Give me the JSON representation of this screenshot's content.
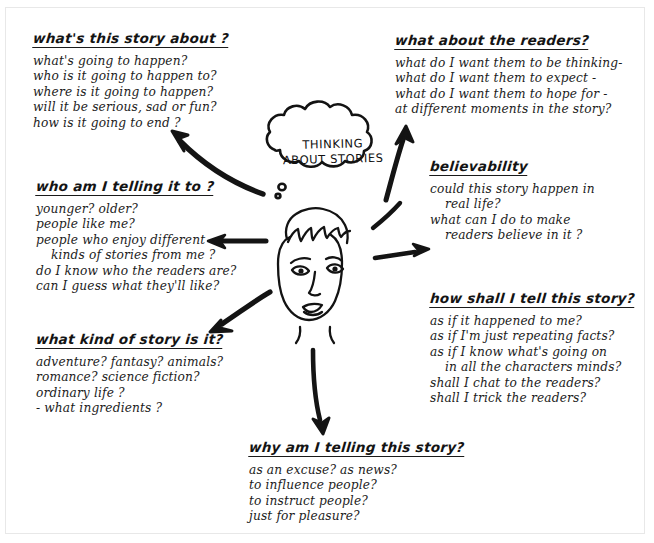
{
  "diagram": {
    "center": {
      "bubble_line1": "Thinking",
      "bubble_line2": "About Stories",
      "figure_name": "boy-face-illustration"
    },
    "ink_color": "#1a1a1a",
    "paper_color": "#ffffff",
    "branches": [
      {
        "id": "story-about",
        "title": "what's this story about ?",
        "lines": [
          "what's going to happen?",
          "who is it going to happen to?",
          "where is it going to happen?",
          "will it be serious, sad or fun?",
          "how is it going to end ?"
        ]
      },
      {
        "id": "about-readers",
        "title": "what about the readers?",
        "lines": [
          "what do I want them to be thinking-",
          "what do I want them to expect -",
          "what do I want them to hope for -",
          "at different moments in the story?"
        ]
      },
      {
        "id": "telling-it-to",
        "title": "who am I telling it to ?",
        "lines": [
          "younger? older?",
          "people like me?",
          "people who enjoy different",
          "kinds of stories from me ?",
          "do I know who the readers are?",
          "can I guess what they'll like?"
        ]
      },
      {
        "id": "believability",
        "title": "believability",
        "lines": [
          "could this story happen in",
          "real life?",
          "what can I do to make",
          "readers believe in it ?"
        ]
      },
      {
        "id": "kind-of-story",
        "title": "what kind of story is it?",
        "lines": [
          "adventure? fantasy? animals?",
          "romance? science fiction?",
          "ordinary life ?",
          "- what ingredients ?"
        ]
      },
      {
        "id": "how-shall-i-tell",
        "title": "how shall I tell this story?",
        "lines": [
          "as if it happened to me?",
          "as if I'm just repeating facts?",
          "as if I know what's going on",
          "in all the characters minds?",
          "shall I chat to the readers?",
          "shall I trick the readers?"
        ]
      },
      {
        "id": "why-telling",
        "title": "why am I telling this story?",
        "lines": [
          "as an excuse?   as news?",
          "to influence people?",
          "to instruct people?",
          "just for pleasure?"
        ]
      }
    ],
    "arrows": [
      {
        "id": "arrow-to-story-about",
        "direction": "up-left"
      },
      {
        "id": "arrow-to-about-readers",
        "direction": "up-right"
      },
      {
        "id": "arrow-to-telling-it-to",
        "direction": "left"
      },
      {
        "id": "arrow-to-believability",
        "direction": "up-right"
      },
      {
        "id": "arrow-to-kind-of-story",
        "direction": "down-left"
      },
      {
        "id": "arrow-to-how-shall-i-tell",
        "direction": "right"
      },
      {
        "id": "arrow-to-why-telling",
        "direction": "down"
      }
    ]
  }
}
